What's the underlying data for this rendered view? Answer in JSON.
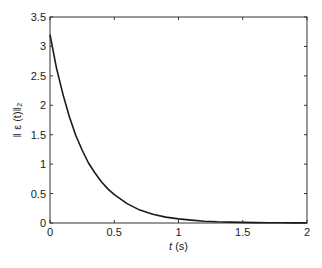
{
  "chart_data": {
    "type": "line",
    "title": "",
    "xlabel": "t (s)",
    "xlabel_italic_part": "t",
    "xlabel_rest": " (s)",
    "ylabel": "‖ ε (t)‖₂",
    "xlim": [
      0,
      2
    ],
    "ylim": [
      0,
      3.5
    ],
    "x_ticks": [
      0,
      0.5,
      1,
      1.5,
      2
    ],
    "x_tick_labels": [
      "0",
      "0.5",
      "1",
      "1.5",
      "2"
    ],
    "y_ticks": [
      0,
      0.5,
      1,
      1.5,
      2,
      2.5,
      3,
      3.5
    ],
    "y_tick_labels": [
      "0",
      "0.5",
      "1",
      "1.5",
      "2",
      "2.5",
      "3",
      "3.5"
    ],
    "grid": false,
    "legend": null,
    "series": [
      {
        "name": "‖ε(t)‖₂",
        "color": "#1a1a1a",
        "x": [
          0,
          0.05,
          0.1,
          0.15,
          0.2,
          0.25,
          0.3,
          0.35,
          0.4,
          0.45,
          0.5,
          0.6,
          0.7,
          0.8,
          0.9,
          1.0,
          1.1,
          1.2,
          1.3,
          1.4,
          1.5,
          1.6,
          1.7,
          1.8,
          1.9,
          2.0
        ],
        "y": [
          3.2,
          2.64,
          2.19,
          1.81,
          1.49,
          1.24,
          1.02,
          0.85,
          0.7,
          0.58,
          0.48,
          0.33,
          0.22,
          0.15,
          0.1,
          0.07,
          0.05,
          0.03,
          0.02,
          0.016,
          0.011,
          0.007,
          0.005,
          0.003,
          0.002,
          0.002
        ]
      }
    ]
  }
}
